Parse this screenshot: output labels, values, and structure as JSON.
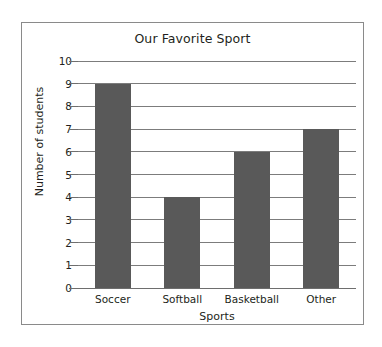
{
  "chart_data": {
    "type": "bar",
    "title": "Our Favorite Sport",
    "xlabel": "Sports",
    "ylabel": "Number of students",
    "categories": [
      "Soccer",
      "Softball",
      "Basketball",
      "Other"
    ],
    "values": [
      9,
      4,
      6,
      7
    ],
    "ylim": [
      0,
      10
    ],
    "ytick_labels": [
      "10",
      "9",
      "8",
      "7",
      "6",
      "5",
      "4",
      "3",
      "2",
      "1",
      "0"
    ],
    "ytick_values": [
      10,
      9,
      8,
      7,
      6,
      5,
      4,
      3,
      2,
      1,
      0
    ],
    "grid": true,
    "legend": false,
    "bar_color": "#595959",
    "grid_color": "#7c7c7c",
    "border_color": "#8a8a8a",
    "background_color": "#ffffff",
    "text_color": "#231f20"
  }
}
